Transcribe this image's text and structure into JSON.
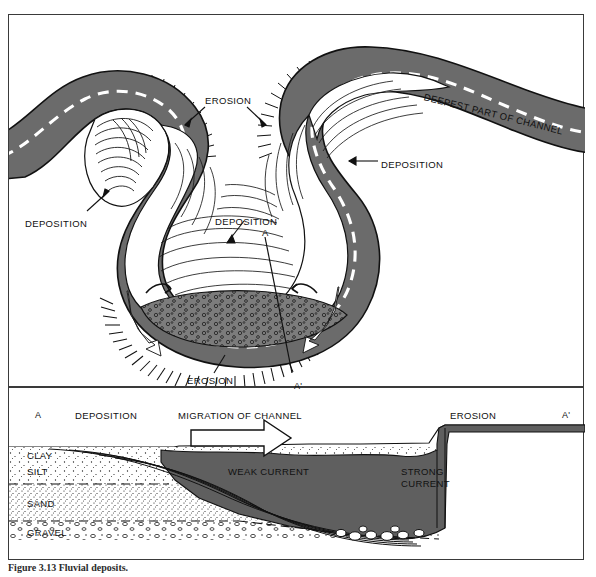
{
  "figure": {
    "caption": "Figure 3.13  Fluvial deposits.",
    "colors": {
      "channel_gray": "#6b6b6b",
      "gravel_gray": "#7a7a7a",
      "water_gray": "#5f5f5f",
      "outline": "#111111",
      "border": "#3a3a3a",
      "dash_white": "#ffffff"
    }
  },
  "map_view": {
    "name": "meander-plan-view",
    "labels": [
      {
        "id": "erosion-top",
        "text": "EROSION",
        "x": 196,
        "y": 80
      },
      {
        "id": "deepest-part",
        "text": "DEEPEST PART OF CHANNEL",
        "x": 415,
        "y": 76
      },
      {
        "id": "deposition-right",
        "text": "DEPOSITION",
        "x": 372,
        "y": 144
      },
      {
        "id": "deposition-left",
        "text": "DEPOSITION",
        "x": 16,
        "y": 203
      },
      {
        "id": "deposition-center",
        "text": "DEPOSITION",
        "x": 206,
        "y": 201
      },
      {
        "id": "erosion-bottom",
        "text": "EROSION",
        "x": 178,
        "y": 360
      },
      {
        "id": "section-marker-a",
        "text": "A",
        "x": 253,
        "y": 212
      },
      {
        "id": "section-marker-a2",
        "text": "A'",
        "x": 285,
        "y": 366
      }
    ]
  },
  "cross_section": {
    "name": "channel-cross-section",
    "top_labels": [
      {
        "id": "xs-a",
        "text": "A",
        "x": 26,
        "y": 28
      },
      {
        "id": "xs-dep",
        "text": "DEPOSITION",
        "x": 66,
        "y": 28
      },
      {
        "id": "xs-migration",
        "text": "MIGRATION OF CHANNEL",
        "x": 169,
        "y": 28
      },
      {
        "id": "xs-erosion",
        "text": "EROSION",
        "x": 441,
        "y": 28
      },
      {
        "id": "xs-a2",
        "text": "A'",
        "x": 553,
        "y": 28
      }
    ],
    "strata": [
      {
        "id": "clay",
        "text": "CLAY",
        "x": 18,
        "y": 70
      },
      {
        "id": "silt",
        "text": "SILT",
        "x": 18,
        "y": 86
      },
      {
        "id": "sand",
        "text": "SAND",
        "x": 18,
        "y": 118
      },
      {
        "id": "gravel",
        "text": "GRAVEL",
        "x": 18,
        "y": 147
      }
    ],
    "current_labels": [
      {
        "id": "weak-current",
        "text": "WEAK CURRENT",
        "x": 219,
        "y": 86
      },
      {
        "id": "strong-current-1",
        "text": "STRONG",
        "x": 392,
        "y": 86
      },
      {
        "id": "strong-current-2",
        "text": "CURRENT",
        "x": 392,
        "y": 98
      }
    ],
    "migration_arrow": {
      "id": "migration-arrow",
      "direction": "right"
    }
  }
}
